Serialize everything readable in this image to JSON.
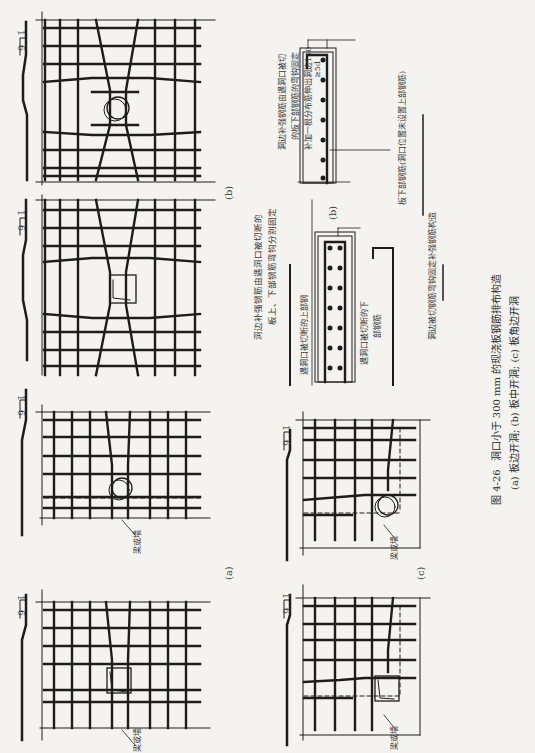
{
  "figure": {
    "number": "图 4-26",
    "title": "洞口小于 300 mm 的现浇板钢筋排布构造",
    "subcaption": "(a) 板边开洞; (b) 板中开洞; (c) 板角边开洞"
  },
  "panels": {
    "a": {
      "label": "(a)",
      "beam_label": "梁或墙",
      "slope_top": "1",
      "slope_bottom": "6"
    },
    "b": {
      "label": "(b)",
      "slope_top": "1",
      "slope_bottom": "6"
    },
    "c": {
      "label": "(c)",
      "beam_label": "梁或墙",
      "slope_top": "1",
      "slope_bottom": "6"
    }
  },
  "sections": {
    "b_left": {
      "note": [
        "洞边补强钢筋由遇洞口被切断的",
        "板上、下部钢筋弯钩分别固定"
      ],
      "upper_label": "遇洞口被切断的上部钢",
      "lower_label": [
        "遇洞口被切断的下",
        "部钢筋"
      ]
    },
    "b_right": {
      "label": "(b)",
      "note": [
        "洞边补强钢筋由遇洞口被切",
        "的板下部钢筋的弯钩固定",
        "补加一根分布筋伸出洞边150"
      ],
      "dim": "≥5d",
      "bottom_label": "板下部钢筋(洞口位置未设置上部钢筋)",
      "footer_label": "洞边被切钢筋弯钩固定补强钢筋构造"
    }
  }
}
